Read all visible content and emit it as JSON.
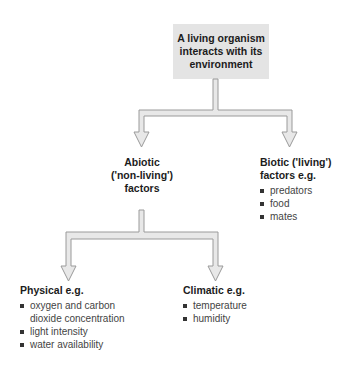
{
  "root": {
    "lines": [
      "A living organism",
      "interacts with its",
      "environment"
    ]
  },
  "abiotic": {
    "lines": [
      "Abiotic",
      "('non-living')",
      "factors"
    ]
  },
  "biotic": {
    "lines": [
      "Biotic ('living')",
      "factors e.g."
    ],
    "items": [
      "predators",
      "food",
      "mates"
    ]
  },
  "physical": {
    "heading": "Physical e.g.",
    "items": [
      "oxygen and carbon dioxide concentration",
      "light intensity",
      "water availability"
    ]
  },
  "climatic": {
    "heading": "Climatic e.g.",
    "items": [
      "temperature",
      "humidity"
    ]
  },
  "colors": {
    "box_fill": "#e4e4e4",
    "arrow_fill": "#e8e8e8",
    "arrow_stroke": "#9a9a9a"
  }
}
